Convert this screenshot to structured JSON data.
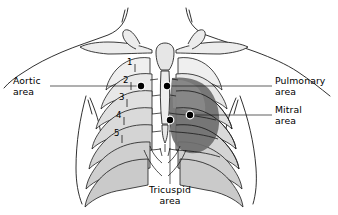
{
  "figure": {
    "background_color": "#ffffff",
    "ink_color": "#000000"
  },
  "labels": {
    "aortic": "Aortic\narea",
    "pulmonary": "Pulmonary\narea",
    "mitral": "Mitral\narea",
    "tricuspid": "Tricuspid\narea"
  },
  "rib_numbers": [
    "1",
    "2",
    "3",
    "4",
    "5"
  ],
  "markers": [
    {
      "name": "aortic-point",
      "x": 141,
      "y": 86
    },
    {
      "name": "pulmonary-point",
      "x": 167,
      "y": 86
    },
    {
      "name": "mitral-point",
      "x": 190,
      "y": 115
    },
    {
      "name": "tricuspid-point",
      "x": 170,
      "y": 120
    }
  ],
  "colors": {
    "outline": "#1a1a1a",
    "bone_light": "#f2f2f2",
    "bone_shade": "#c9c9c9",
    "heart_shadow": "#6e6e6e",
    "heart_shadow_light": "#9a9a9a",
    "marker_fill": "#000000",
    "marker_ring": "#ffffff"
  }
}
